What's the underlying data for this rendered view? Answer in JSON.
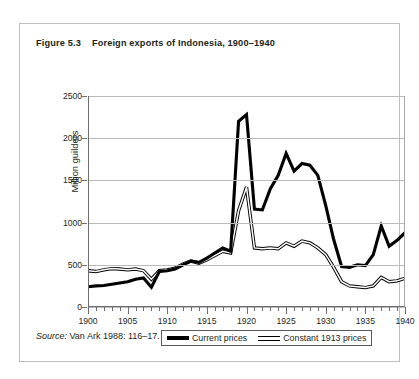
{
  "figure": {
    "number": "Figure 5.3",
    "title": "Foreign exports of Indonesia, 1900–1940",
    "source_prefix": "Source:",
    "source_text": " Van Ark 1988: 116–17."
  },
  "colors": {
    "current_prices": "#000000",
    "constant_prices_fill": "#ffffff",
    "constant_prices_stroke": "#000000",
    "gridline": "#b8babc",
    "axis": "#6d6e71",
    "box_border": "#bcbec0",
    "text": "#231f20"
  },
  "chart_data": {
    "type": "line",
    "title": "Foreign exports of Indonesia, 1900–1940",
    "xlabel": "",
    "ylabel": "Million guilders",
    "xlim": [
      1900,
      1940
    ],
    "ylim": [
      0,
      2500
    ],
    "ytick_labels": [
      "0",
      "500",
      "1000",
      "1500",
      "2000",
      "2500"
    ],
    "yticks": [
      0,
      500,
      1000,
      1500,
      2000,
      2500
    ],
    "xtick_labels": [
      "1900",
      "1905",
      "1910",
      "1915",
      "1920",
      "1925",
      "1930",
      "1935",
      "1940"
    ],
    "xticks": [
      1900,
      1905,
      1910,
      1915,
      1920,
      1925,
      1930,
      1935,
      1940
    ],
    "x_minor_tick_interval": 1,
    "grid": "horizontal",
    "legend_position": "below-axes",
    "x": [
      1900,
      1901,
      1902,
      1903,
      1904,
      1905,
      1906,
      1907,
      1908,
      1909,
      1910,
      1911,
      1912,
      1913,
      1914,
      1915,
      1916,
      1917,
      1918,
      1919,
      1920,
      1921,
      1922,
      1923,
      1924,
      1925,
      1926,
      1927,
      1928,
      1929,
      1930,
      1931,
      1932,
      1933,
      1934,
      1935,
      1936,
      1937,
      1938,
      1939,
      1940
    ],
    "series": [
      {
        "name": "Current prices",
        "style": "thick-solid-black",
        "values": [
          240,
          250,
          255,
          270,
          285,
          300,
          330,
          345,
          235,
          420,
          430,
          450,
          500,
          545,
          530,
          580,
          640,
          700,
          660,
          2200,
          2280,
          1160,
          1150,
          1400,
          1560,
          1820,
          1610,
          1700,
          1680,
          1560,
          1200,
          800,
          480,
          470,
          500,
          490,
          620,
          960,
          720,
          790,
          880
        ]
      },
      {
        "name": "Constant 1913 prices",
        "style": "thin-hollow-white",
        "values": [
          430,
          420,
          440,
          455,
          450,
          440,
          450,
          430,
          330,
          430,
          440,
          460,
          510,
          545,
          520,
          560,
          610,
          660,
          640,
          1140,
          1420,
          700,
          690,
          700,
          690,
          760,
          720,
          780,
          760,
          700,
          620,
          470,
          300,
          250,
          240,
          230,
          250,
          350,
          300,
          310,
          340
        ]
      }
    ],
    "annotations": []
  },
  "legend": {
    "items": [
      {
        "label": "Current prices",
        "swatch": "solid-black-line"
      },
      {
        "label": "Constant 1913 prices",
        "swatch": "hollow-white-line"
      }
    ]
  }
}
